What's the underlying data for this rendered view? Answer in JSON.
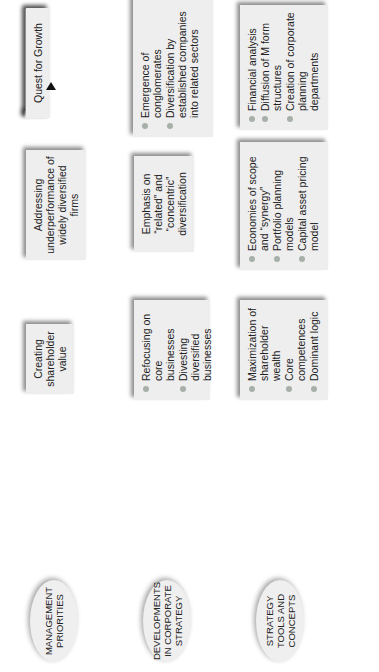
{
  "rows": [
    {
      "label": "MANAGEMENT PRIORITIES"
    },
    {
      "label": "DEVELOPMENTS IN CORPORATE STRATEGY"
    },
    {
      "label": "STRATEGY TOOLS AND CONCEPTS"
    }
  ],
  "periods": [
    {
      "priority": "Quest for Growth",
      "strategy": [
        "Emergence of conglomerates",
        "Diversification by established companies into related sectors"
      ],
      "tools": [
        "Financial analysis",
        "Diffusion of M form structures",
        "Creation of corporate planning departments"
      ]
    },
    {
      "priority": "Addressing underperformance of widely diversified firms",
      "strategy_text": "Emphasis on “related” and “concentric” diversification",
      "tools": [
        "Economies of scope and “synergy”",
        "Portfolio planning models",
        "Capital asset pricing model"
      ]
    },
    {
      "priority": "Creating shareholder value",
      "strategy": [
        "Refocusing on core businesses",
        "Divesting diversified businesses"
      ],
      "tools": [
        "Maximization of shareholder wealth",
        "Core competences",
        "Dominant logic"
      ]
    },
    {
      "priority_list": [
        "Competitive advantage through speed and flexibility",
        "Creating opportunities for future growth"
      ],
      "strategy": [
        "Joint ventures and alliances",
        "Creating growth options through focused diversification"
      ],
      "tools": [
        "Dynamic capabilities",
        "Transaction cost analysis",
        "Real options"
      ]
    }
  ],
  "timeline": {
    "ticks": [
      "1960",
      "1970",
      "1980",
      "1990",
      "2000",
      "2006"
    ]
  },
  "colors": {
    "box_bg": "#eeeeee",
    "bullet": "#a7b0a8",
    "axis": "#111111"
  }
}
